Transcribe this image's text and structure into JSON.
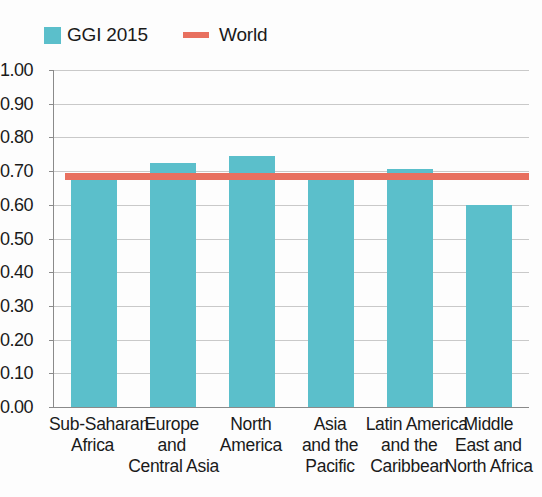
{
  "legend": {
    "entries": [
      {
        "label": "GGI 2015",
        "marker": "square-swatch",
        "color": "#5bbfcb"
      },
      {
        "label": "World",
        "marker": "line-swatch",
        "color": "#e8705f"
      }
    ]
  },
  "chart_data": {
    "type": "bar",
    "title": "",
    "subtitle": "",
    "xlabel": "",
    "ylabel": "",
    "ylim": [
      0.0,
      1.0
    ],
    "ytick_labels": [
      "1.00",
      "0.90",
      "0.80",
      "0.70",
      "0.60",
      "0.50",
      "0.40",
      "0.30",
      "0.20",
      "0.10",
      "0.00"
    ],
    "ytick_values": [
      1.0,
      0.9,
      0.8,
      0.7,
      0.6,
      0.5,
      0.4,
      0.3,
      0.2,
      0.1,
      0.0
    ],
    "grid": true,
    "legend_position": "top-left",
    "bar_color": "#5bbfcb",
    "reference_line_color": "#e8705f",
    "categories": [
      "Sub-Saharan Africa",
      "Europe and Central Asia",
      "North America",
      "Asia and the Pacific",
      "Latin America and the Caribbean",
      "Middle East and North Africa"
    ],
    "category_lines": [
      [
        "Sub-Saharan",
        "Africa"
      ],
      [
        "Europe",
        "and",
        "Central Asia"
      ],
      [
        "North",
        "America"
      ],
      [
        "Asia",
        "and the",
        "Pacific"
      ],
      [
        "Latin America",
        "and the",
        "Caribbean"
      ],
      [
        "Middle",
        "East and",
        "North Africa"
      ]
    ],
    "series": [
      {
        "name": "GGI 2015",
        "values": [
          0.675,
          0.725,
          0.745,
          0.68,
          0.705,
          0.6
        ]
      }
    ],
    "reference_lines": [
      {
        "name": "World",
        "value": 0.685
      }
    ]
  }
}
